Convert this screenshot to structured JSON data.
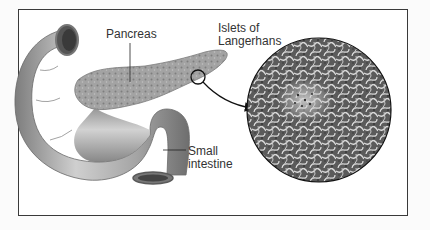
{
  "figure": {
    "type": "anatomical-illustration",
    "labels": {
      "pancreas": "Pancreas",
      "islets_line1": "Islets of",
      "islets_line2": "Langerhans",
      "small_intestine_line1": "Small",
      "small_intestine_line2": "intestine"
    },
    "colors": {
      "frame": "#3a3a3a",
      "tissue_dark": "#5a5a5a",
      "tissue_light": "#d8d8d8",
      "intestine": "#a8a8a8",
      "pancreas": "#9a9a9a",
      "label_text": "#333333",
      "leader_line": "#222222"
    }
  }
}
